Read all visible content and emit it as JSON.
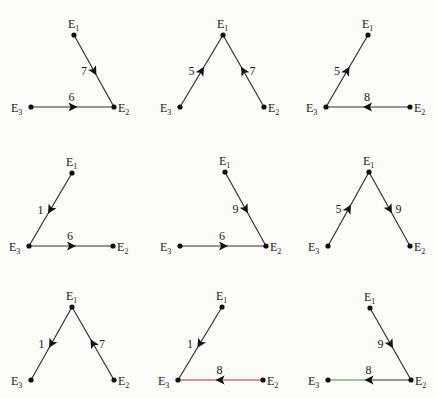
{
  "colors": {
    "edge": "#333333",
    "red": "#c2253c",
    "green": "#3a9a3a",
    "node": "#111111",
    "background": "#fbfbf8"
  },
  "panels": [
    {
      "id": 1,
      "nodes": {
        "E1": [
          74,
          35
        ],
        "E2": [
          114,
          107
        ],
        "E3": [
          31,
          107
        ]
      },
      "edges": [
        {
          "from": "E1",
          "to": "E2",
          "weight": "7",
          "dir": "forward"
        },
        {
          "from": "E3",
          "to": "E2",
          "weight": "6",
          "dir": "forward"
        }
      ]
    },
    {
      "id": 2,
      "nodes": {
        "E1": [
          223,
          35
        ],
        "E2": [
          264,
          107
        ],
        "E3": [
          180,
          107
        ]
      },
      "edges": [
        {
          "from": "E3",
          "to": "E1",
          "weight": "5",
          "dir": "forward"
        },
        {
          "from": "E2",
          "to": "E1",
          "weight": "7",
          "dir": "forward"
        }
      ]
    },
    {
      "id": 3,
      "nodes": {
        "E1": [
          368,
          35
        ],
        "E2": [
          410,
          107
        ],
        "E3": [
          326,
          107
        ]
      },
      "edges": [
        {
          "from": "E3",
          "to": "E1",
          "weight": "5",
          "dir": "forward"
        },
        {
          "from": "E2",
          "to": "E3",
          "weight": "8",
          "dir": "forward"
        }
      ]
    },
    {
      "id": 4,
      "nodes": {
        "E1": [
          72,
          173
        ],
        "E2": [
          113,
          246
        ],
        "E3": [
          29,
          246
        ]
      },
      "edges": [
        {
          "from": "E1",
          "to": "E3",
          "weight": "1",
          "dir": "forward"
        },
        {
          "from": "E3",
          "to": "E2",
          "weight": "6",
          "dir": "forward"
        }
      ]
    },
    {
      "id": 5,
      "nodes": {
        "E1": [
          225,
          172
        ],
        "E2": [
          266,
          246
        ],
        "E3": [
          180,
          246
        ]
      },
      "edges": [
        {
          "from": "E1",
          "to": "E2",
          "weight": "9",
          "dir": "forward"
        },
        {
          "from": "E3",
          "to": "E2",
          "weight": "6",
          "dir": "forward"
        }
      ]
    },
    {
      "id": 6,
      "nodes": {
        "E1": [
          369,
          172
        ],
        "E2": [
          410,
          246
        ],
        "E3": [
          328,
          246
        ]
      },
      "edges": [
        {
          "from": "E3",
          "to": "E1",
          "weight": "5",
          "dir": "forward"
        },
        {
          "from": "E1",
          "to": "E2",
          "weight": "9",
          "dir": "forward"
        }
      ]
    },
    {
      "id": 7,
      "nodes": {
        "E1": [
          72,
          307
        ],
        "E2": [
          114,
          380
        ],
        "E3": [
          31,
          380
        ]
      },
      "edges": [
        {
          "from": "E1",
          "to": "E3",
          "weight": "1",
          "dir": "forward"
        },
        {
          "from": "E2",
          "to": "E1",
          "weight": "7",
          "dir": "forward"
        }
      ]
    },
    {
      "id": 8,
      "nodes": {
        "E1": [
          222,
          307
        ],
        "E2": [
          263,
          380
        ],
        "E3": [
          178,
          380
        ]
      },
      "edges": [
        {
          "from": "E1",
          "to": "E3",
          "weight": "1",
          "dir": "forward"
        },
        {
          "from": "E2",
          "to": "E3",
          "weight": "8",
          "dir": "forward",
          "color": "red"
        }
      ]
    },
    {
      "id": 9,
      "nodes": {
        "E1": [
          370,
          308
        ],
        "E2": [
          411,
          380
        ],
        "E3": [
          328,
          380
        ]
      },
      "edges": [
        {
          "from": "E1",
          "to": "E2",
          "weight": "9",
          "dir": "forward"
        },
        {
          "from": "E2",
          "to": "E3",
          "weight": "8",
          "dir": "forward",
          "color": "green_tail"
        }
      ]
    }
  ]
}
